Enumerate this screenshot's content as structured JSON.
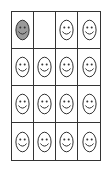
{
  "diagram": {
    "rows": 4,
    "columns": 4,
    "colors": {
      "grid_line": "#333333",
      "face_outline": "#333333",
      "face_fill_default": "#ffffff",
      "face_fill_shaded": "#9a9a9a"
    },
    "cells": [
      [
        {
          "face": "shaded"
        },
        {
          "face": "empty"
        },
        {
          "face": "plain"
        },
        {
          "face": "plain"
        }
      ],
      [
        {
          "face": "plain"
        },
        {
          "face": "plain"
        },
        {
          "face": "plain"
        },
        {
          "face": "plain"
        }
      ],
      [
        {
          "face": "plain"
        },
        {
          "face": "plain"
        },
        {
          "face": "plain"
        },
        {
          "face": "plain"
        }
      ],
      [
        {
          "face": "plain"
        },
        {
          "face": "plain"
        },
        {
          "face": "plain"
        },
        {
          "face": "plain"
        }
      ]
    ],
    "counts": {
      "shaded_faces": 1,
      "plain_faces": 14,
      "empty_cells": 1
    }
  }
}
